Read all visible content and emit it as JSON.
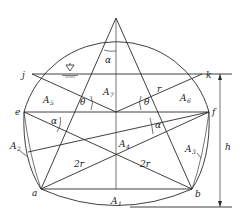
{
  "diagram": {
    "type": "geometric cross-section (horseshoe tunnel with five-point star construction)",
    "points": {
      "top": {
        "x": 116,
        "y": 18
      },
      "j": {
        "label": "j",
        "x": 32,
        "y": 74
      },
      "k": {
        "label": "k",
        "x": 202,
        "y": 74
      },
      "e": {
        "label": "e",
        "x": 24,
        "y": 112
      },
      "f": {
        "label": "f",
        "x": 209,
        "y": 112
      },
      "center": {
        "x": 116,
        "y": 112
      },
      "cross": {
        "x": 116,
        "y": 155
      },
      "a": {
        "label": "a",
        "x": 41,
        "y": 189
      },
      "b": {
        "label": "b",
        "x": 192,
        "y": 189
      },
      "bottom": {
        "x": 116,
        "y": 207
      }
    },
    "labels": {
      "j": "j",
      "k": "k",
      "e": "e",
      "f": "f",
      "a": "a",
      "b": "b",
      "A1": "A",
      "A1_sub": "1",
      "A2": "A",
      "A2_sub": "2",
      "A3": "A",
      "A3_sub": "3",
      "A4": "A",
      "A4_sub": "4",
      "A5": "A",
      "A5_sub": "5",
      "A6": "A",
      "A6_sub": "6",
      "A7": "A",
      "A7_sub": "7",
      "alpha_top": "α",
      "alpha_left": "α",
      "alpha_right": "α",
      "theta_left": "θ",
      "theta_right": "θ",
      "r": "r",
      "two_r_left": "2r",
      "two_r_right": "2r",
      "h": "h"
    },
    "symbols": {
      "water_level": "water-level-marker"
    },
    "colors": {
      "stroke": "#2a2a2a",
      "background": "#ffffff"
    }
  }
}
